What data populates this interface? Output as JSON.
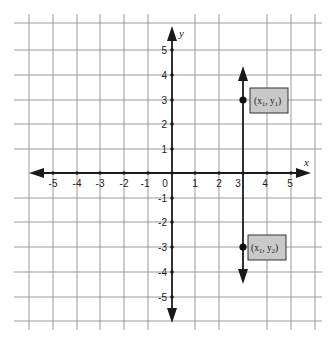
{
  "diagram": {
    "type": "coordinate-plane",
    "axes": {
      "x_label": "x",
      "y_label": "y",
      "origin_label": "0",
      "x_ticks": [
        "-5",
        "-4",
        "-3",
        "-2",
        "-1",
        "1",
        "2",
        "3",
        "4",
        "5"
      ],
      "y_ticks": [
        "5",
        "4",
        "3",
        "2",
        "1",
        "-1",
        "-2",
        "-3",
        "-4",
        "-5"
      ],
      "x_range": [
        -5,
        5
      ],
      "y_range": [
        -5,
        5
      ]
    },
    "vertical_line": {
      "x": 3,
      "description": "vertical line x = 3 with arrows at both ends"
    },
    "points": [
      {
        "x": 3,
        "y": 3,
        "label": "(x1, y1)",
        "label_main": "(x",
        "sub1": "1",
        "mid": ", y",
        "sub2": "1",
        "end": ")"
      },
      {
        "x": 3,
        "y": -3,
        "label": "(x1, y2)",
        "label_main": "(x",
        "sub1": "1",
        "mid": ", y",
        "sub2": "2",
        "end": ")"
      }
    ],
    "colors": {
      "grid": "#9a9a9a",
      "axis": "#1a1a1a",
      "label_box_fill": "#c9c9c9",
      "label_box_border": "#333333"
    }
  }
}
